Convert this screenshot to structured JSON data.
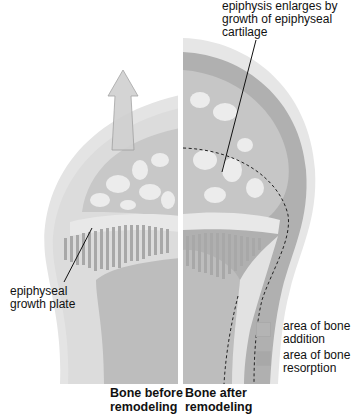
{
  "labels": {
    "top_right": "epiphysis enlarges by growth of epiphyseal cartilage",
    "top_right_lines": [
      "epiphysis enlarges by",
      "growth of epiphyseal",
      "cartilage"
    ],
    "left": "epiphyseal growth plate",
    "left_lines": [
      "epiphyseal",
      "growth plate"
    ]
  },
  "legend": [
    {
      "label_lines": [
        "area of bone",
        "addition"
      ],
      "color": "#b4b4b4"
    },
    {
      "label_lines": [
        "area of bone",
        "resorption"
      ],
      "color": "#a8a8a8"
    }
  ],
  "captions": {
    "before_lines": [
      "Bone before",
      "remodeling"
    ],
    "after_lines": [
      "Bone after",
      "remodeling"
    ]
  },
  "colors": {
    "cartilage": "#e6e6e6",
    "bone": "#c2c2c2",
    "spongy": "#d4d4d4",
    "addition": "#b0b0b0",
    "resorption": "#a8a8a8",
    "arrow": "#cfcfcf"
  }
}
